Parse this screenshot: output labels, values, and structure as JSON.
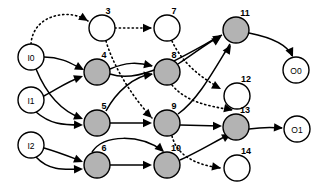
{
  "diagram": {
    "colors": {
      "hidden_node_fill": "#b3b3b3",
      "open_node_fill": "#ffffff",
      "io_node_fill": "#ffffff",
      "stroke": "#000000",
      "background": "#ffffff"
    },
    "nodes": [
      {
        "id": "I0",
        "label": "I0",
        "kind": "input",
        "label_pos": "inside",
        "cx": 31,
        "cy": 57,
        "r": 13
      },
      {
        "id": "I1",
        "label": "I1",
        "kind": "input",
        "label_pos": "inside",
        "cx": 31,
        "cy": 100,
        "r": 13
      },
      {
        "id": "I2",
        "label": "I2",
        "kind": "input",
        "label_pos": "inside",
        "cx": 31,
        "cy": 145,
        "r": 13
      },
      {
        "id": "3",
        "label": "3",
        "kind": "open",
        "label_pos": "outside",
        "cx": 102,
        "cy": 28,
        "r": 13,
        "lx": 108,
        "ly": 11
      },
      {
        "id": "4",
        "label": "4",
        "kind": "hidden",
        "label_pos": "outside",
        "cx": 97,
        "cy": 72,
        "r": 13,
        "lx": 104,
        "ly": 55
      },
      {
        "id": "5",
        "label": "5",
        "kind": "hidden",
        "label_pos": "outside",
        "cx": 97,
        "cy": 123,
        "r": 13,
        "lx": 104,
        "ly": 106
      },
      {
        "id": "6",
        "label": "6",
        "kind": "hidden",
        "label_pos": "outside",
        "cx": 97,
        "cy": 165,
        "r": 13,
        "lx": 104,
        "ly": 148
      },
      {
        "id": "7",
        "label": "7",
        "kind": "open",
        "label_pos": "outside",
        "cx": 167,
        "cy": 28,
        "r": 13,
        "lx": 174,
        "ly": 11
      },
      {
        "id": "8",
        "label": "8",
        "kind": "hidden",
        "label_pos": "outside",
        "cx": 167,
        "cy": 72,
        "r": 13,
        "lx": 174,
        "ly": 55
      },
      {
        "id": "9",
        "label": "9",
        "kind": "hidden",
        "label_pos": "outside",
        "cx": 167,
        "cy": 123,
        "r": 13,
        "lx": 174,
        "ly": 106
      },
      {
        "id": "10",
        "label": "10",
        "kind": "hidden",
        "label_pos": "outside",
        "cx": 167,
        "cy": 165,
        "r": 13,
        "lx": 176,
        "ly": 148
      },
      {
        "id": "11",
        "label": "11",
        "kind": "hidden",
        "label_pos": "outside",
        "cx": 236,
        "cy": 30,
        "r": 13,
        "lx": 245,
        "ly": 13
      },
      {
        "id": "12",
        "label": "12",
        "kind": "open",
        "label_pos": "outside",
        "cx": 237,
        "cy": 96,
        "r": 13,
        "lx": 246,
        "ly": 79
      },
      {
        "id": "13",
        "label": "13",
        "kind": "hidden",
        "label_pos": "outside",
        "cx": 236,
        "cy": 127,
        "r": 13,
        "lx": 245,
        "ly": 110
      },
      {
        "id": "14",
        "label": "14",
        "kind": "open",
        "label_pos": "outside",
        "cx": 237,
        "cy": 168,
        "r": 13,
        "lx": 246,
        "ly": 151
      },
      {
        "id": "O0",
        "label": "O0",
        "kind": "output",
        "label_pos": "inside",
        "cx": 296,
        "cy": 70,
        "r": 13
      },
      {
        "id": "O1",
        "label": "O1",
        "kind": "output",
        "label_pos": "inside",
        "cx": 297,
        "cy": 129,
        "r": 13
      }
    ],
    "edges": [
      {
        "from": "I0",
        "to": "3",
        "style": "dotted",
        "path": "M 31 44 C 33 14 70 8 88 21"
      },
      {
        "from": "I0",
        "to": "4",
        "style": "solid",
        "path": "M 44 57 C 62 57 72 64 82 69"
      },
      {
        "from": "I0",
        "to": "5",
        "style": "solid",
        "path": "M 36 69 C 48 98 64 112 81 118"
      },
      {
        "from": "I1",
        "to": "4",
        "style": "solid",
        "path": "M 44 96 C 56 90 66 82 81 77"
      },
      {
        "from": "I1",
        "to": "5",
        "style": "solid",
        "path": "M 36 112 C 50 124 62 125 81 125"
      },
      {
        "from": "I2",
        "to": "6",
        "style": "solid",
        "path": "M 44 148 C 58 152 68 156 81 161"
      },
      {
        "from": "I2",
        "to": "6",
        "style": "solid",
        "path": "M 36 157 C 48 170 62 170 81 169"
      },
      {
        "from": "3",
        "to": "7",
        "style": "dotted",
        "path": "M 115 28 L 152 28"
      },
      {
        "from": "3",
        "to": "9",
        "style": "dotted",
        "path": "M 106 41 C 112 62 128 92 152 118"
      },
      {
        "from": "4",
        "to": "8",
        "style": "solid",
        "path": "M 110 69 C 126 62 138 62 152 66"
      },
      {
        "from": "4",
        "to": "11",
        "style": "solid",
        "path": "M 110 74 C 140 84 176 60 222 35"
      },
      {
        "from": "5",
        "to": "8",
        "style": "solid",
        "path": "M 106 111 C 116 92 134 76 152 74"
      },
      {
        "from": "5",
        "to": "9",
        "style": "solid",
        "path": "M 110 123 L 150 123"
      },
      {
        "from": "6",
        "to": "10",
        "style": "solid",
        "path": "M 92 152 C 104 134 140 134 163 151"
      },
      {
        "from": "6",
        "to": "10",
        "style": "solid",
        "path": "M 110 165 L 150 165"
      },
      {
        "from": "7",
        "to": "12",
        "style": "dotted",
        "path": "M 172 41 C 180 58 194 74 220 88"
      },
      {
        "from": "8",
        "to": "11",
        "style": "solid",
        "path": "M 178 64 C 196 52 206 44 220 36"
      },
      {
        "from": "8",
        "to": "12",
        "style": "dotted",
        "path": "M 172 85 C 186 102 208 106 232 110"
      },
      {
        "from": "9",
        "to": "11",
        "style": "solid",
        "path": "M 178 114 C 198 100 214 70 230 44"
      },
      {
        "from": "9",
        "to": "13",
        "style": "solid",
        "path": "M 180 125 L 220 126"
      },
      {
        "from": "9",
        "to": "14",
        "style": "dotted",
        "path": "M 172 136 C 176 152 190 164 220 168"
      },
      {
        "from": "10",
        "to": "13",
        "style": "solid",
        "path": "M 180 160 C 198 152 214 142 230 134"
      },
      {
        "from": "11",
        "to": "O0",
        "style": "solid",
        "path": "M 249 33 C 274 38 288 46 292 56"
      },
      {
        "from": "13",
        "to": "O1",
        "style": "solid",
        "path": "M 249 129 C 262 127 272 127 282 128"
      }
    ],
    "arrowheads": [
      {
        "x": 88,
        "y": 21,
        "angle": 32,
        "style": "dotted",
        "name": "arrow-i0-to-3"
      },
      {
        "x": 84,
        "y": 70,
        "angle": 28,
        "style": "solid",
        "name": "arrow-i0-to-4"
      },
      {
        "x": 83,
        "y": 119,
        "angle": 22,
        "style": "solid",
        "name": "arrow-i0-to-5"
      },
      {
        "x": 83,
        "y": 76,
        "angle": -20,
        "style": "solid",
        "name": "arrow-i1-to-4"
      },
      {
        "x": 83,
        "y": 125,
        "angle": 2,
        "style": "solid",
        "name": "arrow-i1-to-5"
      },
      {
        "x": 83,
        "y": 162,
        "angle": 22,
        "style": "solid",
        "name": "arrow-i2-to-6"
      },
      {
        "x": 83,
        "y": 169,
        "angle": -2,
        "style": "solid",
        "name": "arrow-i2-to-6b"
      },
      {
        "x": 152,
        "y": 28,
        "angle": 0,
        "style": "dotted",
        "name": "arrow-3-to-7"
      },
      {
        "x": 152,
        "y": 118,
        "angle": 44,
        "style": "dotted",
        "name": "arrow-3-to-9"
      },
      {
        "x": 153,
        "y": 66,
        "angle": 12,
        "style": "solid",
        "name": "arrow-4-to-8"
      },
      {
        "x": 222,
        "y": 35,
        "angle": -32,
        "style": "solid",
        "name": "arrow-4-to-11"
      },
      {
        "x": 153,
        "y": 74,
        "angle": -10,
        "style": "solid",
        "name": "arrow-5-to-8"
      },
      {
        "x": 152,
        "y": 123,
        "angle": 0,
        "style": "solid",
        "name": "arrow-5-to-9"
      },
      {
        "x": 164,
        "y": 152,
        "angle": 42,
        "style": "solid",
        "name": "arrow-6-to-10"
      },
      {
        "x": 152,
        "y": 165,
        "angle": 0,
        "style": "solid",
        "name": "arrow-6-to-10b"
      },
      {
        "x": 221,
        "y": 89,
        "angle": 28,
        "style": "dotted",
        "name": "arrow-7-to-12"
      },
      {
        "x": 221,
        "y": 37,
        "angle": -33,
        "style": "solid",
        "name": "arrow-8-to-11"
      },
      {
        "x": 233,
        "y": 110,
        "angle": 12,
        "style": "dotted",
        "name": "arrow-8-to-12"
      },
      {
        "x": 231,
        "y": 45,
        "angle": -58,
        "style": "solid",
        "name": "arrow-9-to-11"
      },
      {
        "x": 222,
        "y": 126,
        "angle": 0,
        "style": "solid",
        "name": "arrow-9-to-13"
      },
      {
        "x": 221,
        "y": 168,
        "angle": 10,
        "style": "dotted",
        "name": "arrow-9-to-14"
      },
      {
        "x": 231,
        "y": 134,
        "angle": -28,
        "style": "solid",
        "name": "arrow-10-to-13"
      },
      {
        "x": 293,
        "y": 57,
        "angle": 66,
        "style": "solid",
        "name": "arrow-11-to-o0"
      },
      {
        "x": 283,
        "y": 128,
        "angle": 4,
        "style": "solid",
        "name": "arrow-13-to-o1"
      }
    ]
  }
}
